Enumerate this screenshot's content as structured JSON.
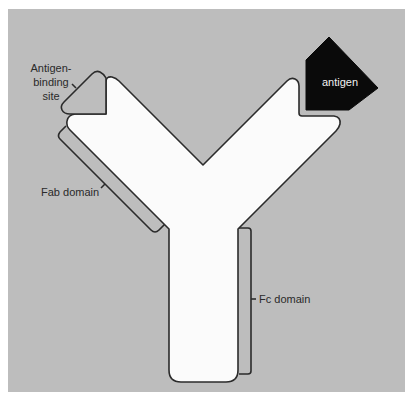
{
  "diagram": {
    "colors": {
      "page_background": "#ffffff",
      "panel_background": "#bdbdbd",
      "antibody_fill": "#fbfbfb",
      "outline": "#2b2b2b",
      "antigen_fill": "#0a0a0a",
      "antigen_text": "#f2f2f2",
      "label_text": "#2a2a2a"
    },
    "labels": {
      "antigen_binding_site": {
        "lines": [
          "Antigen-",
          "binding",
          "site"
        ]
      },
      "fab_domain": "Fab domain",
      "fc_domain": "Fc domain",
      "antigen": "antigen"
    }
  }
}
